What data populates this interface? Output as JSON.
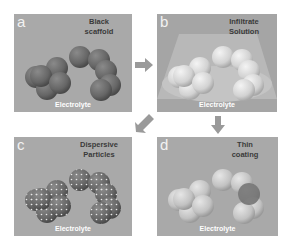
{
  "panels": [
    {
      "letter": "a",
      "title_line1": "Black",
      "title_line2": "scaffold",
      "bottom_label": "Electrolyte",
      "sphere_color": "#6f6f6f"
    },
    {
      "letter": "b",
      "title_line1": "Infiltrate",
      "title_line2": "Solution",
      "bottom_label": "Electrolyte",
      "sphere_color": "#d8d8d8"
    },
    {
      "letter": "c",
      "title_line1": "Dispersive",
      "title_line2": "Particles",
      "bottom_label": "Electrolyte",
      "sphere_color": "#707070"
    },
    {
      "letter": "d",
      "title_line1": "Thin",
      "title_line2": "coating",
      "bottom_label": "Electrolyte",
      "sphere_color": "#c8c8c8"
    }
  ],
  "arrows": [
    {
      "from": "a",
      "to": "b",
      "direction": "right"
    },
    {
      "from": "b",
      "to": "d",
      "direction": "down"
    },
    {
      "from": "b",
      "to": "c",
      "direction": "down-left"
    }
  ],
  "colors": {
    "panel_bg": "#a9a9a9",
    "arrow": "#9a9a9a"
  }
}
